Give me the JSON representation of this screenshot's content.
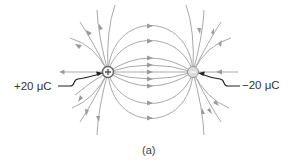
{
  "diagram": {
    "caption": "(a)",
    "charges": [
      {
        "sign": "+",
        "label": "+20 μC",
        "value_uC": 20,
        "x": 108,
        "y": 72
      },
      {
        "sign": "−",
        "label": "−20 μC",
        "value_uC": -20,
        "x": 193,
        "y": 72
      }
    ],
    "colors": {
      "field_line": "#a9a9a9",
      "arrow": "#9a9a9a",
      "pointer": "#222222",
      "text": "#333333"
    }
  }
}
